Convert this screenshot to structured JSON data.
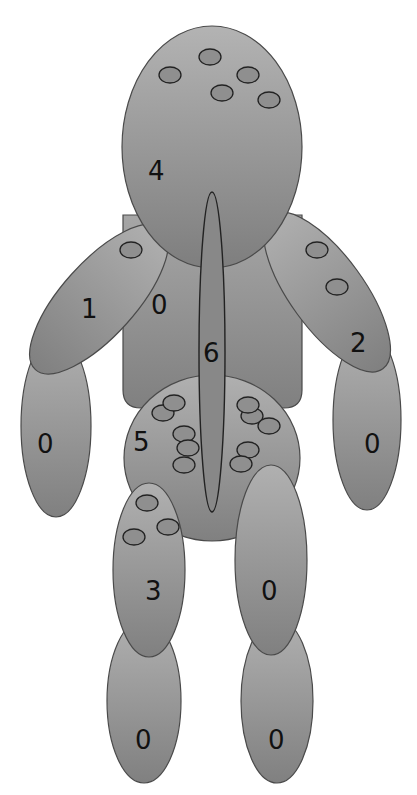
{
  "figure": {
    "type": "body-map diagram",
    "background": "#ffffff",
    "colors": {
      "fill_light": "#ababab",
      "fill_dark": "#858585",
      "spot_fill": "#8f8f8f",
      "stroke": "#4a4a4a",
      "spot_stroke": "#222222",
      "label": "#111111"
    }
  },
  "regions": [
    {
      "id": "head",
      "label": "4",
      "spot_count": 5
    },
    {
      "id": "left-upper-arm",
      "label": "1",
      "spot_count": 1
    },
    {
      "id": "left-forearm",
      "label": "0",
      "spot_count": 0
    },
    {
      "id": "right-upper-arm",
      "label": "2",
      "spot_count": 2
    },
    {
      "id": "right-forearm",
      "label": "0",
      "spot_count": 0
    },
    {
      "id": "torso",
      "label": "0",
      "spot_count": 0
    },
    {
      "id": "spine",
      "label": "6",
      "spot_count": 0
    },
    {
      "id": "pelvis",
      "label": "5",
      "spot_count": 10
    },
    {
      "id": "left-thigh",
      "label": "3",
      "spot_count": 3
    },
    {
      "id": "right-thigh",
      "label": "0",
      "spot_count": 0
    },
    {
      "id": "left-lower-leg",
      "label": "0",
      "spot_count": 0
    },
    {
      "id": "right-lower-leg",
      "label": "0",
      "spot_count": 0
    }
  ]
}
